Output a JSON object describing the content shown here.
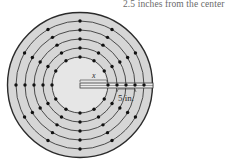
{
  "caption": "2.5 inches from the center",
  "diagram": {
    "labels": {
      "radius_variable": "x",
      "outer_measure": "5 in."
    },
    "rings": 5,
    "dots_per_ring": 12,
    "colors": {
      "disk_fill": "#d6d6d6",
      "inner_fill": "#e6e6e6",
      "outline": "#2b2b2b",
      "ring_line": "#3a3a3a",
      "dot": "#111111"
    }
  }
}
